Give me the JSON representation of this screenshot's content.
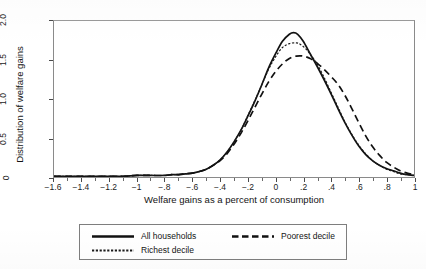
{
  "chart_data": {
    "type": "line",
    "title": "",
    "subtitle": "",
    "xlabel": "Welfare gains as a percent of consumption",
    "ylabel": "Distribution of welfare gains",
    "xlim": [
      -1.6,
      1.0
    ],
    "ylim": [
      0,
      2.0
    ],
    "grid": false,
    "legend_position": "below-plot",
    "x_tick_labels": [
      "-1.6",
      "-1.4",
      "-1.2",
      "-1",
      "-.8",
      "-.6",
      "-.4",
      "-.2",
      "0",
      ".2",
      ".4",
      ".6",
      ".8",
      "1"
    ],
    "x_tick_values": [
      -1.6,
      -1.4,
      -1.2,
      -1.0,
      -0.8,
      -0.6,
      -0.4,
      -0.2,
      0,
      0.2,
      0.4,
      0.6,
      0.8,
      1.0
    ],
    "x_minor_tick_values": [
      -1.5,
      -1.3,
      -1.1,
      -0.9,
      -0.7,
      -0.5,
      -0.3,
      -0.1,
      0.1,
      0.3,
      0.5,
      0.7,
      0.9
    ],
    "y_tick_labels": [
      "0",
      "0.5",
      "1.0",
      "1.5",
      "2.0"
    ],
    "y_tick_values": [
      0,
      0.5,
      1.0,
      1.5,
      2.0
    ],
    "series": [
      {
        "name": "All households",
        "style": "solid",
        "color": "#111111",
        "peak_x": 0.13,
        "peak_y": 1.85,
        "x": [
          -1.6,
          -1.5,
          -1.4,
          -1.3,
          -1.2,
          -1.1,
          -1.0,
          -0.9,
          -0.8,
          -0.75,
          -0.7,
          -0.65,
          -0.6,
          -0.55,
          -0.5,
          -0.45,
          -0.4,
          -0.35,
          -0.3,
          -0.25,
          -0.2,
          -0.15,
          -0.1,
          -0.05,
          0.0,
          0.05,
          0.1,
          0.13,
          0.16,
          0.2,
          0.25,
          0.3,
          0.35,
          0.4,
          0.45,
          0.5,
          0.55,
          0.6,
          0.65,
          0.7,
          0.75,
          0.8,
          0.85,
          0.9,
          0.95,
          1.0
        ],
        "values": [
          0.01,
          0.01,
          0.01,
          0.01,
          0.01,
          0.01,
          0.02,
          0.02,
          0.02,
          0.03,
          0.03,
          0.04,
          0.05,
          0.07,
          0.1,
          0.15,
          0.22,
          0.32,
          0.45,
          0.6,
          0.78,
          0.97,
          1.18,
          1.4,
          1.58,
          1.74,
          1.83,
          1.85,
          1.83,
          1.74,
          1.58,
          1.42,
          1.25,
          1.07,
          0.88,
          0.7,
          0.54,
          0.4,
          0.29,
          0.21,
          0.15,
          0.11,
          0.08,
          0.05,
          0.03,
          0.02
        ]
      },
      {
        "name": "Poorest decile",
        "style": "dashed",
        "color": "#111111",
        "peak_x": 0.2,
        "peak_y": 1.55,
        "x": [
          -1.6,
          -1.5,
          -1.4,
          -1.3,
          -1.2,
          -1.1,
          -1.0,
          -0.9,
          -0.8,
          -0.75,
          -0.7,
          -0.65,
          -0.6,
          -0.55,
          -0.5,
          -0.45,
          -0.4,
          -0.35,
          -0.3,
          -0.25,
          -0.2,
          -0.15,
          -0.1,
          -0.05,
          0.0,
          0.05,
          0.1,
          0.15,
          0.2,
          0.25,
          0.3,
          0.35,
          0.4,
          0.45,
          0.5,
          0.55,
          0.6,
          0.65,
          0.7,
          0.75,
          0.8,
          0.85,
          0.9,
          0.95,
          1.0
        ],
        "values": [
          0.01,
          0.01,
          0.01,
          0.01,
          0.01,
          0.01,
          0.02,
          0.02,
          0.02,
          0.03,
          0.03,
          0.04,
          0.05,
          0.07,
          0.1,
          0.15,
          0.21,
          0.3,
          0.42,
          0.56,
          0.72,
          0.89,
          1.06,
          1.22,
          1.35,
          1.45,
          1.52,
          1.55,
          1.55,
          1.52,
          1.46,
          1.38,
          1.29,
          1.19,
          1.05,
          0.88,
          0.7,
          0.53,
          0.39,
          0.28,
          0.19,
          0.13,
          0.08,
          0.05,
          0.03
        ]
      },
      {
        "name": "Richest decile",
        "style": "dotted",
        "color": "#111111",
        "peak_x": 0.15,
        "peak_y": 1.72,
        "x": [
          -1.6,
          -1.5,
          -1.4,
          -1.3,
          -1.2,
          -1.1,
          -1.0,
          -0.9,
          -0.8,
          -0.75,
          -0.7,
          -0.65,
          -0.6,
          -0.55,
          -0.5,
          -0.45,
          -0.4,
          -0.35,
          -0.3,
          -0.25,
          -0.2,
          -0.15,
          -0.1,
          -0.05,
          0.0,
          0.05,
          0.1,
          0.15,
          0.18,
          0.22,
          0.26,
          0.3,
          0.35,
          0.4,
          0.45,
          0.5,
          0.55,
          0.6,
          0.65,
          0.7,
          0.75,
          0.8,
          0.85,
          0.9,
          0.95,
          1.0
        ],
        "values": [
          0.01,
          0.01,
          0.01,
          0.01,
          0.01,
          0.01,
          0.02,
          0.02,
          0.02,
          0.03,
          0.03,
          0.04,
          0.05,
          0.07,
          0.1,
          0.15,
          0.22,
          0.32,
          0.45,
          0.6,
          0.79,
          0.98,
          1.18,
          1.38,
          1.54,
          1.66,
          1.71,
          1.72,
          1.7,
          1.64,
          1.55,
          1.45,
          1.28,
          1.09,
          0.9,
          0.71,
          0.55,
          0.41,
          0.3,
          0.21,
          0.15,
          0.1,
          0.07,
          0.04,
          0.03,
          0.02
        ]
      }
    ],
    "legend": [
      {
        "label": "All households",
        "style": "solid"
      },
      {
        "label": "Poorest decile",
        "style": "dashed"
      },
      {
        "label": "Richest decile",
        "style": "dotted"
      }
    ]
  }
}
